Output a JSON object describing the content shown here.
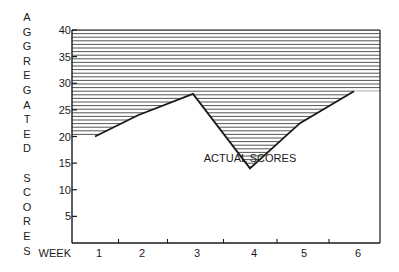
{
  "chart_data": {
    "type": "area",
    "title": "",
    "xlabel": "WEEK",
    "ylabel": "AGGREGATED SCORES",
    "ylabel_letters": [
      "A",
      "G",
      "G",
      "R",
      "E",
      "G",
      "A",
      "T",
      "E",
      "D",
      " ",
      "S",
      "C",
      "O",
      "R",
      "E",
      "S"
    ],
    "categories": [
      "1",
      "2",
      "3",
      "4",
      "5",
      "6"
    ],
    "series": [
      {
        "name": "ACTUAL SCORES",
        "values": [
          20,
          24,
          28,
          14,
          22.5,
          28.5
        ]
      }
    ],
    "hatched_region": "area between actual scores line and ceiling of 40 (shaded with horizontal lines)",
    "yticks": [
      40,
      35,
      30,
      25,
      20,
      15,
      10,
      5
    ],
    "ylim": [
      0,
      40
    ],
    "annotation": "ACTUAL SCORES",
    "grid": false,
    "colors": {
      "line": "#1a1a1a",
      "hatch": "#555555",
      "background": "#ffffff"
    }
  }
}
